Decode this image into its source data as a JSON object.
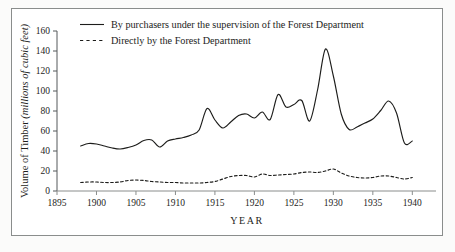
{
  "chart_data": {
    "type": "line",
    "title": "",
    "xlabel": "YEAR",
    "ylabel": "Volume of Timber (millions of cubic feet)",
    "ylabel_plain": "Volume of Timber",
    "ylabel_italic": "(millions of cubic feet)",
    "xlim": [
      1895,
      1943
    ],
    "ylim": [
      0,
      160
    ],
    "xticks": [
      1895,
      1900,
      1905,
      1910,
      1915,
      1920,
      1925,
      1930,
      1935,
      1940
    ],
    "yticks": [
      0,
      20,
      40,
      60,
      80,
      100,
      120,
      140,
      160
    ],
    "grid": false,
    "legend_position": "top-left-inside",
    "series": [
      {
        "name": "By purchasers under the supervision of the Forest Department",
        "style": "solid",
        "color": "#1d1d1b",
        "x": [
          1898,
          1899,
          1900,
          1901,
          1902,
          1903,
          1904,
          1905,
          1906,
          1907,
          1908,
          1909,
          1910,
          1911,
          1912,
          1913,
          1914,
          1915,
          1916,
          1917,
          1918,
          1919,
          1920,
          1921,
          1922,
          1923,
          1924,
          1925,
          1926,
          1927,
          1928,
          1929,
          1930,
          1931,
          1932,
          1933,
          1934,
          1935,
          1936,
          1937,
          1938,
          1939,
          1940
        ],
        "values": [
          45,
          47.5,
          47,
          45,
          43,
          42,
          43.5,
          46,
          50.5,
          51,
          44,
          50,
          52,
          53.5,
          56,
          61,
          82.5,
          71,
          63,
          69,
          75.5,
          77,
          73,
          79,
          71.5,
          96.5,
          84,
          86.5,
          90.5,
          70,
          101,
          142,
          115,
          77,
          61.5,
          64,
          68,
          72,
          80.5,
          90,
          78,
          48,
          50
        ]
      },
      {
        "name": "Directly by the Forest Department",
        "style": "dashed",
        "color": "#1d1d1b",
        "x": [
          1898,
          1899,
          1900,
          1901,
          1902,
          1903,
          1904,
          1905,
          1906,
          1907,
          1908,
          1909,
          1910,
          1911,
          1912,
          1913,
          1914,
          1915,
          1916,
          1917,
          1918,
          1919,
          1920,
          1921,
          1922,
          1923,
          1924,
          1925,
          1926,
          1927,
          1928,
          1929,
          1930,
          1931,
          1932,
          1933,
          1934,
          1935,
          1936,
          1937,
          1938,
          1939,
          1940
        ],
        "values": [
          8.5,
          9,
          9,
          8.5,
          8.5,
          9,
          10.5,
          11,
          10.5,
          9.5,
          9,
          8.5,
          8.5,
          8,
          8,
          8,
          8.5,
          9.5,
          12,
          14.5,
          15.5,
          15.5,
          14,
          17,
          15.5,
          16,
          16.5,
          17,
          18.5,
          19,
          18.5,
          20,
          22,
          18,
          15,
          13.5,
          13,
          13.5,
          15,
          15,
          13.5,
          12,
          13.5
        ]
      }
    ]
  },
  "legend": {
    "items": [
      {
        "label": "By purchasers under the supervision of the Forest Department",
        "style": "solid"
      },
      {
        "label": "Directly by the Forest Department",
        "style": "dashed"
      }
    ]
  }
}
